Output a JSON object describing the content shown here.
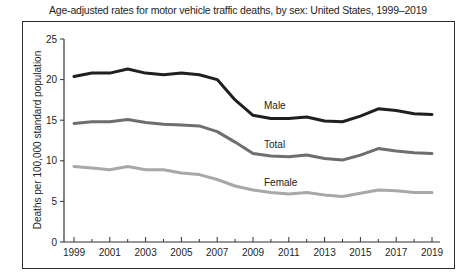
{
  "chart_data": {
    "type": "line",
    "title": "Age-adjusted rates for motor vehicle traffic deaths, by sex: United States, 1999–2019",
    "xlabel": "",
    "ylabel": "Deaths per 100,000 standard population",
    "ylim": [
      0,
      25
    ],
    "yticks": [
      0,
      5,
      10,
      15,
      20,
      25
    ],
    "xticks_labeled": [
      "1999",
      "2001",
      "2003",
      "2005",
      "2007",
      "2009",
      "2011",
      "2013",
      "2015",
      "2017",
      "2019"
    ],
    "x": [
      1999,
      2000,
      2001,
      2002,
      2003,
      2004,
      2005,
      2006,
      2007,
      2008,
      2009,
      2010,
      2011,
      2012,
      2013,
      2014,
      2015,
      2016,
      2017,
      2018,
      2019
    ],
    "grid": false,
    "legend": "inline labels",
    "series": [
      {
        "name": "Male",
        "color": "#1f1f1f",
        "values": [
          20.4,
          20.8,
          20.8,
          21.3,
          20.8,
          20.6,
          20.8,
          20.6,
          20.0,
          17.5,
          15.6,
          15.2,
          15.2,
          15.4,
          14.9,
          14.8,
          15.5,
          16.4,
          16.2,
          15.8,
          15.7
        ]
      },
      {
        "name": "Total",
        "color": "#6e6e6e",
        "values": [
          14.6,
          14.8,
          14.8,
          15.1,
          14.7,
          14.5,
          14.4,
          14.3,
          13.6,
          12.3,
          10.9,
          10.6,
          10.5,
          10.7,
          10.3,
          10.1,
          10.7,
          11.5,
          11.2,
          11.0,
          10.9
        ]
      },
      {
        "name": "Female",
        "color": "#a8a8a8",
        "values": [
          9.3,
          9.1,
          8.9,
          9.3,
          8.9,
          8.9,
          8.5,
          8.3,
          7.7,
          6.9,
          6.4,
          6.1,
          5.9,
          6.1,
          5.8,
          5.6,
          6.0,
          6.4,
          6.3,
          6.1,
          6.1
        ]
      }
    ]
  },
  "labels": {
    "title": "Age-adjusted rates for motor vehicle traffic deaths, by sex: United States, 1999–2019",
    "ylabel": "Deaths per 100,000 standard population",
    "male": "Male",
    "total": "Total",
    "female": "Female"
  }
}
